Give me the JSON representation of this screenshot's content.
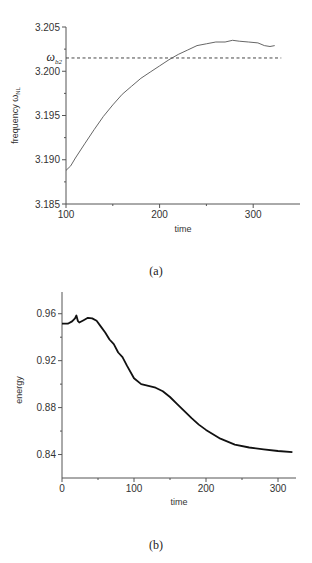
{
  "chart_data": [
    {
      "id": "a",
      "type": "line",
      "caption": "(a)",
      "xlabel": "time",
      "ylabel": "frequency ω",
      "ylabel_sub": "NL",
      "xlim": [
        100,
        350
      ],
      "ylim": [
        3.185,
        3.205
      ],
      "xticks": [
        100,
        200,
        300
      ],
      "xtick_labels": [
        "100",
        "200",
        "300"
      ],
      "yticks": [
        3.185,
        3.19,
        3.195,
        3.2,
        3.205
      ],
      "ytick_labels": [
        "3.185",
        "3.190",
        "3.195",
        "3.200",
        "3.205"
      ],
      "grid": false,
      "reference_line": {
        "label": "ω",
        "label_sub": "b2",
        "value": 3.2015,
        "style": "dashed",
        "x_range": [
          100,
          330
        ]
      },
      "series": [
        {
          "name": "frequency",
          "x": [
            100,
            105,
            110,
            120,
            130,
            140,
            150,
            160,
            170,
            180,
            190,
            200,
            210,
            220,
            230,
            240,
            250,
            260,
            270,
            278,
            285,
            295,
            305,
            312,
            318,
            323
          ],
          "y": [
            3.1888,
            3.1893,
            3.1902,
            3.1918,
            3.1934,
            3.1949,
            3.1962,
            3.1974,
            3.1983,
            3.1992,
            3.1999,
            3.2006,
            3.2013,
            3.2019,
            3.2024,
            3.2029,
            3.2031,
            3.2033,
            3.2033,
            3.2035,
            3.2034,
            3.2033,
            3.2032,
            3.2029,
            3.2028,
            3.2029
          ]
        }
      ]
    },
    {
      "id": "b",
      "type": "line",
      "caption": "(b)",
      "xlabel": "time",
      "ylabel": "energy",
      "xlim": [
        0,
        325
      ],
      "ylim": [
        0.82,
        0.97
      ],
      "xticks": [
        0,
        100,
        200,
        300
      ],
      "xtick_labels": [
        "0",
        "100",
        "200",
        "300"
      ],
      "yticks": [
        0.84,
        0.88,
        0.92,
        0.96
      ],
      "ytick_labels": [
        "0.84",
        "0.88",
        "0.92",
        "0.96"
      ],
      "grid": false,
      "series": [
        {
          "name": "energy",
          "x": [
            0,
            8,
            14,
            18,
            20,
            22,
            24,
            30,
            36,
            42,
            48,
            54,
            60,
            66,
            72,
            78,
            84,
            90,
            100,
            110,
            120,
            130,
            140,
            150,
            160,
            170,
            180,
            190,
            200,
            220,
            240,
            260,
            280,
            300,
            320
          ],
          "y": [
            0.9515,
            0.9515,
            0.9535,
            0.956,
            0.9585,
            0.954,
            0.9525,
            0.9545,
            0.9565,
            0.956,
            0.954,
            0.949,
            0.944,
            0.938,
            0.934,
            0.927,
            0.923,
            0.916,
            0.905,
            0.9,
            0.8985,
            0.897,
            0.894,
            0.889,
            0.883,
            0.877,
            0.871,
            0.8655,
            0.861,
            0.8535,
            0.8485,
            0.846,
            0.8445,
            0.843,
            0.842
          ]
        }
      ]
    }
  ]
}
